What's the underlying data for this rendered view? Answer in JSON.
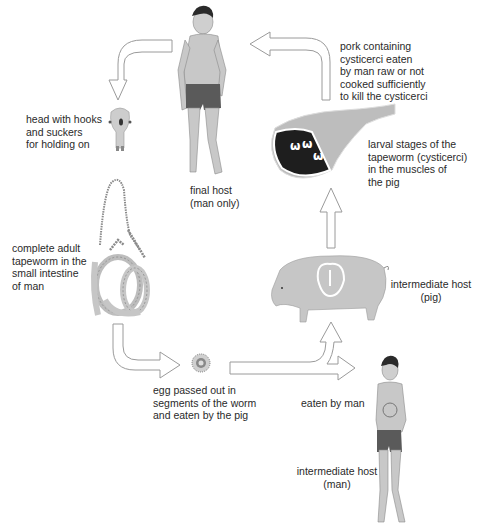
{
  "diagram": {
    "colors": {
      "background": "#ffffff",
      "skin": "#c8c8c8",
      "skin_outline": "#8a8a8a",
      "hair": "#2b2b2b",
      "shorts": "#5a5a5a",
      "ham": "#bdbdbd",
      "ham_muscle": "#1e1e1e",
      "pig": "#c6c6c6",
      "arrow_outline": "#9a9a9a",
      "text": "#2a2a2a"
    },
    "nodes": {
      "final_host": {
        "label_line1": "final host",
        "label_line2": "(man only)",
        "icon": "man-figure"
      },
      "head": {
        "label_line1": "head with hooks",
        "label_line2": "and suckers",
        "label_line3": "for holding on",
        "icon": "scolex"
      },
      "adult_worm": {
        "label_line1": "complete adult",
        "label_line2": "tapeworm in the",
        "label_line3": "small intestine",
        "label_line4": "of man",
        "icon": "coiled-tapeworm"
      },
      "egg": {
        "label_line1": "egg passed out in",
        "label_line2": "segments of the worm",
        "label_line3": "and eaten by the pig",
        "icon": "egg"
      },
      "pig": {
        "label_line1": "intermediate host",
        "label_line2": "(pig)",
        "icon": "pig"
      },
      "eaten_by_man": {
        "label": "eaten by man"
      },
      "intermediate_man": {
        "label_line1": "intermediate host",
        "label_line2": "(man)",
        "icon": "man-figure-with-cyst"
      },
      "larval": {
        "label_line1": "larval stages of the",
        "label_line2": "tapeworm (cysticerci)",
        "label_line3": "in the muscles of",
        "label_line4": "the pig",
        "icon": "ham-with-cysticerci"
      },
      "pork": {
        "label_line1": "pork containing",
        "label_line2": "cysticerci eaten",
        "label_line3": "by man raw or not",
        "label_line4": "cooked sufficiently",
        "label_line5": "to kill the cysticerci"
      }
    },
    "edges": [
      {
        "from": "final_host",
        "to": "head"
      },
      {
        "from": "adult_worm",
        "to": "egg"
      },
      {
        "from": "egg",
        "to": "pig"
      },
      {
        "from": "egg",
        "to": "intermediate_man"
      },
      {
        "from": "pig",
        "to": "larval"
      },
      {
        "from": "larval",
        "to": "final_host"
      }
    ]
  }
}
